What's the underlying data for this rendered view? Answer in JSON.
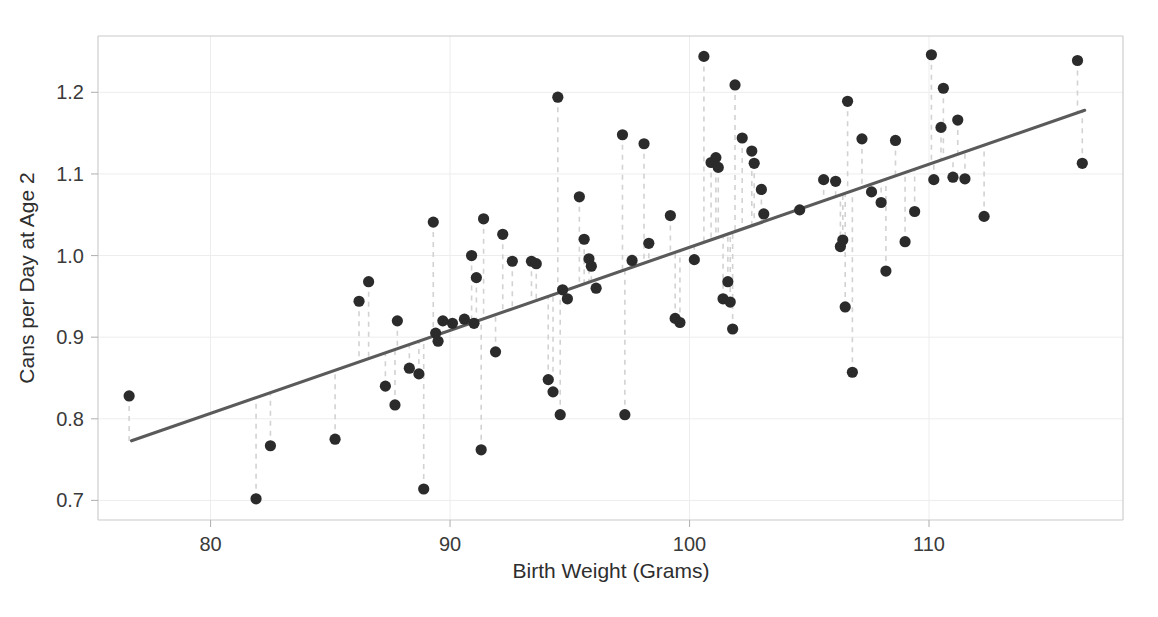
{
  "chart_data": {
    "type": "scatter",
    "title": "",
    "xlabel": "Birth Weight (Grams)",
    "ylabel": "Cans per Day at Age 2",
    "xlim": [
      75.3,
      118.1
    ],
    "ylim": [
      0.676,
      1.269
    ],
    "xticks": [
      80,
      90,
      100,
      110
    ],
    "xtick_labels": [
      "80",
      "90",
      "100",
      "110"
    ],
    "yticks": [
      0.7,
      0.8,
      0.9,
      1.0,
      1.1,
      1.2
    ],
    "ytick_labels": [
      "0.7",
      "0.8",
      "0.9",
      "1.0",
      "1.1",
      "1.2"
    ],
    "grid": true,
    "legend": "none",
    "point_color": "#2b2b2b",
    "line_color": "#5a5a5a",
    "residual_color": "#d2d2d2",
    "fit_line": {
      "label": "least-squares regression line",
      "x_start": 76.7,
      "y_start": 0.773,
      "x_end": 116.5,
      "y_end": 1.178,
      "slope": 0.01018,
      "intercept": -0.0077
    },
    "residual_segments": true,
    "x": [
      76.6,
      81.9,
      82.5,
      85.2,
      86.2,
      86.6,
      87.3,
      87.7,
      87.8,
      88.3,
      88.7,
      88.9,
      89.3,
      89.4,
      89.5,
      89.7,
      90.1,
      90.6,
      90.9,
      91.0,
      91.1,
      91.3,
      91.4,
      91.9,
      92.2,
      92.6,
      93.4,
      93.6,
      94.1,
      94.3,
      94.5,
      94.6,
      94.7,
      94.9,
      95.4,
      95.6,
      95.8,
      95.9,
      96.1,
      97.2,
      97.3,
      97.6,
      98.1,
      98.3,
      99.2,
      99.4,
      99.6,
      100.2,
      100.6,
      100.9,
      101.1,
      101.2,
      101.4,
      101.6,
      101.7,
      101.8,
      101.9,
      102.2,
      102.6,
      102.7,
      103.0,
      103.1,
      104.6,
      105.6,
      106.1,
      106.3,
      106.4,
      106.5,
      106.6,
      106.8,
      107.2,
      107.6,
      108.0,
      108.2,
      108.6,
      109.0,
      109.4,
      110.1,
      110.2,
      110.5,
      110.6,
      111.0,
      111.2,
      111.5,
      112.3,
      116.2,
      116.4
    ],
    "y": [
      0.828,
      0.702,
      0.767,
      0.775,
      0.944,
      0.968,
      0.84,
      0.817,
      0.92,
      0.862,
      0.855,
      0.714,
      1.041,
      0.905,
      0.895,
      0.92,
      0.917,
      0.922,
      1.0,
      0.917,
      0.973,
      0.762,
      1.045,
      0.882,
      1.026,
      0.993,
      0.993,
      0.99,
      0.848,
      0.833,
      1.194,
      0.805,
      0.958,
      0.947,
      1.072,
      1.02,
      0.996,
      0.987,
      0.96,
      1.148,
      0.805,
      0.994,
      1.137,
      1.015,
      1.049,
      0.923,
      0.918,
      0.995,
      1.244,
      1.114,
      1.12,
      1.108,
      0.947,
      0.968,
      0.943,
      0.91,
      1.209,
      1.144,
      1.128,
      1.113,
      1.081,
      1.051,
      1.056,
      1.093,
      1.091,
      1.011,
      1.019,
      0.937,
      1.189,
      0.857,
      1.143,
      1.078,
      1.065,
      0.981,
      1.141,
      1.017,
      1.054,
      1.246,
      1.093,
      1.157,
      1.205,
      1.096,
      1.166,
      1.094,
      1.048,
      1.239,
      1.113
    ]
  }
}
